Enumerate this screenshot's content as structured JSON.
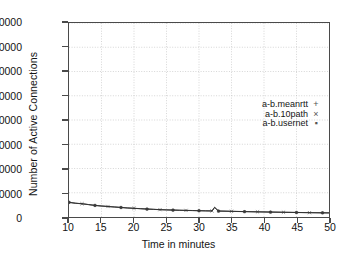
{
  "chart_data": {
    "type": "line",
    "title": "",
    "xlabel": "Time in minutes",
    "ylabel": "Number of Active Connections",
    "xlim": [
      10,
      50
    ],
    "ylim": [
      0,
      80000
    ],
    "xticks": [
      10,
      15,
      20,
      25,
      30,
      35,
      40,
      45,
      50
    ],
    "yticks": [
      0,
      10000,
      20000,
      30000,
      40000,
      50000,
      60000,
      70000,
      80000
    ],
    "grid": true,
    "legend_position": "center-right",
    "x": [
      10,
      11,
      12,
      13,
      14,
      15,
      16,
      17,
      18,
      19,
      20,
      21,
      22,
      23,
      24,
      25,
      26,
      27,
      28,
      29,
      30,
      31,
      32,
      32.4,
      33,
      34,
      35,
      36,
      37,
      38,
      39,
      40,
      41,
      42,
      43,
      44,
      45,
      46,
      47,
      48,
      49,
      50
    ],
    "series": [
      {
        "name": "a-b.meanrtt",
        "marker": "+",
        "values": [
          6100,
          5700,
          5500,
          5150,
          4800,
          4550,
          4350,
          4150,
          3950,
          3750,
          3600,
          3450,
          3300,
          3180,
          3050,
          2960,
          2880,
          2800,
          2740,
          2680,
          2620,
          2560,
          2520,
          4050,
          2480,
          2420,
          2360,
          2300,
          2250,
          2200,
          2150,
          2100,
          2060,
          2010,
          1970,
          1930,
          1890,
          1850,
          1810,
          1780,
          1750,
          1720
        ]
      },
      {
        "name": "a-b.10path",
        "marker": "×",
        "values": [
          6050,
          5680,
          5460,
          5120,
          4780,
          4530,
          4330,
          4130,
          3930,
          3730,
          3580,
          3430,
          3280,
          3160,
          3030,
          2940,
          2860,
          2780,
          2720,
          2660,
          2600,
          2540,
          2500,
          3950,
          2460,
          2400,
          2340,
          2280,
          2230,
          2180,
          2130,
          2080,
          2040,
          1990,
          1950,
          1910,
          1870,
          1830,
          1790,
          1760,
          1730,
          1700
        ]
      },
      {
        "name": "a-b.usernet",
        "marker": "▪",
        "values": [
          6000,
          5650,
          5430,
          5090,
          4750,
          4500,
          4300,
          4100,
          3900,
          3700,
          3550,
          3400,
          3250,
          3130,
          3000,
          2910,
          2830,
          2750,
          2690,
          2630,
          2570,
          2510,
          2470,
          3900,
          2430,
          2370,
          2310,
          2250,
          2200,
          2150,
          2100,
          2050,
          2010,
          1960,
          1920,
          1880,
          1840,
          1800,
          1760,
          1730,
          1700,
          1670
        ]
      }
    ]
  }
}
